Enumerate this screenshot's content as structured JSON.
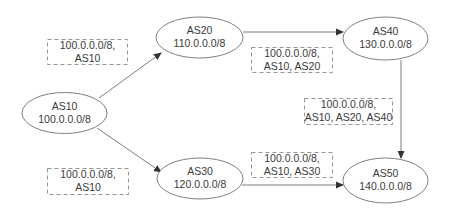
{
  "diagram": {
    "colors": {
      "line": "#6e6e6e",
      "node_border": "#707070",
      "box_border": "#8a8a8a",
      "text": "#3a3a3a"
    },
    "nodes": [
      {
        "id": "AS10",
        "name": "AS10",
        "prefix": "100.0.0.0/8"
      },
      {
        "id": "AS20",
        "name": "AS20",
        "prefix": "110.0.0.0/8"
      },
      {
        "id": "AS30",
        "name": "AS30",
        "prefix": "120.0.0.0/8"
      },
      {
        "id": "AS40",
        "name": "AS40",
        "prefix": "130.0.0.0/8"
      },
      {
        "id": "AS50",
        "name": "AS50",
        "prefix": "140.0.0.0/8"
      }
    ],
    "edges": [
      {
        "from": "AS10",
        "to": "AS20"
      },
      {
        "from": "AS10",
        "to": "AS30"
      },
      {
        "from": "AS20",
        "to": "AS40"
      },
      {
        "from": "AS30",
        "to": "AS50"
      },
      {
        "from": "AS40",
        "to": "AS50"
      }
    ],
    "route_labels": [
      {
        "edge": "AS10-AS20",
        "line1": "100.0.0.0/8,",
        "line2": "AS10"
      },
      {
        "edge": "AS10-AS30",
        "line1": "100.0.0.0/8,",
        "line2": "AS10"
      },
      {
        "edge": "AS20-AS40",
        "line1": "100.0.0.0/8,",
        "line2": "AS10, AS20"
      },
      {
        "edge": "AS40-AS50",
        "line1": "100.0.0.0/8,",
        "line2": "AS10, AS20, AS40"
      },
      {
        "edge": "AS30-AS50",
        "line1": "100.0.0.0/8,",
        "line2": "AS10, AS30"
      }
    ]
  }
}
